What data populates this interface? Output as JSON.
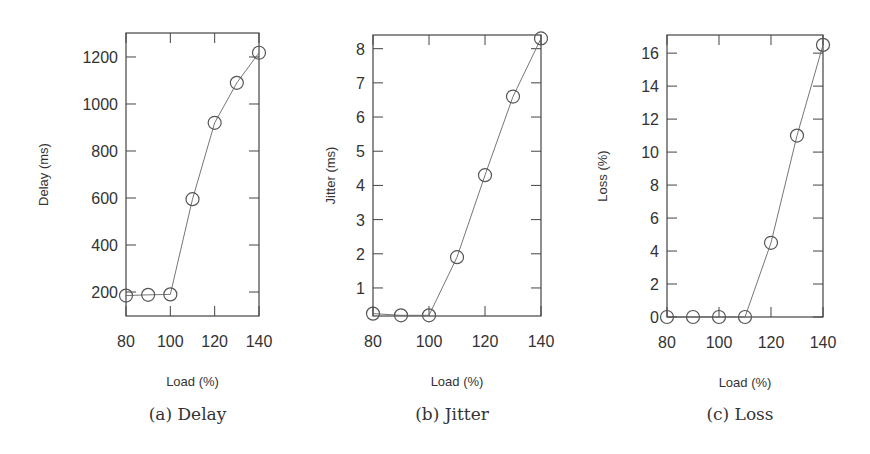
{
  "figure": {
    "captions": [
      "(a) Delay",
      "(b) Jitter",
      "(c) Loss"
    ]
  },
  "chart_data": [
    {
      "type": "line",
      "id": "delay",
      "title": "",
      "caption": "(a) Delay",
      "xlabel": "Load (%)",
      "ylabel": "Delay (ms)",
      "x": [
        80,
        90,
        100,
        110,
        120,
        130,
        140
      ],
      "series": [
        {
          "name": "Delay",
          "values": [
            185,
            188,
            190,
            595,
            920,
            1090,
            1218
          ],
          "marker": "open-circle"
        }
      ],
      "xticks": [
        80,
        100,
        120,
        140
      ],
      "yticks": [
        200,
        400,
        600,
        800,
        1000,
        1200
      ],
      "xlim": [
        80,
        140
      ],
      "ylim": [
        98,
        1302
      ],
      "grid": false,
      "legend": "none",
      "frame": {
        "left": 126,
        "right": 259,
        "top": 33,
        "bottom": 316
      }
    },
    {
      "type": "line",
      "id": "jitter",
      "title": "",
      "caption": "(b) Jitter",
      "xlabel": "Load (%)",
      "ylabel": "Jitter (ms)",
      "x": [
        80,
        90,
        100,
        110,
        120,
        130,
        140
      ],
      "series": [
        {
          "name": "Jitter",
          "values": [
            0.25,
            0.2,
            0.2,
            1.9,
            4.3,
            6.6,
            8.3
          ],
          "marker": "open-circle"
        }
      ],
      "xticks": [
        80,
        100,
        120,
        140
      ],
      "yticks": [
        1,
        2,
        3,
        4,
        5,
        6,
        7,
        8
      ],
      "xlim": [
        80,
        140
      ],
      "ylim": [
        0.18,
        8.4
      ],
      "grid": false,
      "legend": "none",
      "frame": {
        "left": 373,
        "right": 541,
        "top": 35,
        "bottom": 316
      }
    },
    {
      "type": "line",
      "id": "loss",
      "title": "",
      "caption": "(c) Loss",
      "xlabel": "Load (%)",
      "ylabel": "Loss (%)",
      "x": [
        80,
        90,
        100,
        110,
        120,
        130,
        140
      ],
      "series": [
        {
          "name": "Loss",
          "values": [
            0,
            0,
            0,
            0,
            4.5,
            11,
            16.5
          ],
          "marker": "open-circle"
        }
      ],
      "xticks": [
        80,
        100,
        120,
        140
      ],
      "yticks": [
        0,
        2,
        4,
        6,
        8,
        10,
        12,
        14,
        16
      ],
      "xlim": [
        80,
        140
      ],
      "ylim": [
        0,
        17.1
      ],
      "grid": false,
      "legend": "none",
      "frame": {
        "left": 667,
        "right": 823,
        "top": 35,
        "bottom": 317
      }
    }
  ],
  "style": {
    "line_color": "#666666",
    "frame_color": "#444444",
    "marker_color": "#555555",
    "text_color": "#333333"
  }
}
